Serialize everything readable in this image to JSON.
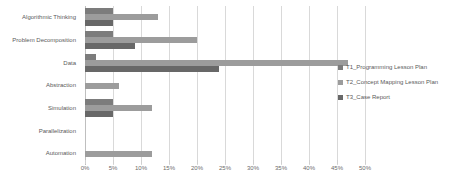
{
  "chart_data": {
    "type": "bar",
    "orientation": "horizontal",
    "title": "",
    "subtitle": "",
    "xlabel": "",
    "ylabel": "",
    "xlim": [
      0,
      50
    ],
    "xtick_labels": [
      "0%",
      "5%",
      "10%",
      "15%",
      "20%",
      "25%",
      "30%",
      "35%",
      "40%",
      "45%",
      "50%"
    ],
    "xtick_values": [
      0,
      5,
      10,
      15,
      20,
      25,
      30,
      35,
      40,
      45,
      50
    ],
    "grid": true,
    "legend_position": "right",
    "categories": [
      "Algorithmic Thinking",
      "Problem Decomposition",
      "Data",
      "Abstraction",
      "Simulation",
      "Parallelization",
      "Automation"
    ],
    "series": [
      {
        "name": "T1_Programming Lesson Plan",
        "color": "#7c7c7c",
        "values": [
          5,
          5,
          2,
          0,
          5,
          0,
          0
        ]
      },
      {
        "name": "T2_Concept Mapping Lesson Plan",
        "color": "#9c9c9c",
        "values": [
          13,
          20,
          47,
          6,
          12,
          0,
          12
        ]
      },
      {
        "name": "T3_Case Report",
        "color": "#686868",
        "values": [
          5,
          9,
          24,
          0,
          5,
          0,
          0
        ]
      }
    ]
  }
}
